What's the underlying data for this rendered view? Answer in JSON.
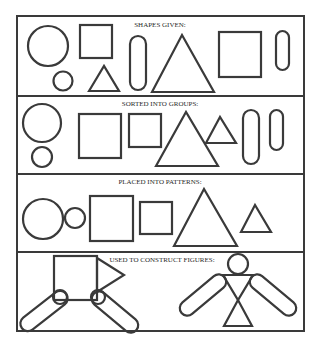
{
  "diagram": {
    "background": "#ffffff",
    "stroke_color": "#3a3a3a",
    "panels": [
      {
        "title": "SHAPES GIVEN:",
        "shapes": [
          "circle-large",
          "circle-small",
          "square-small",
          "triangle-small",
          "capsule-large",
          "triangle-large",
          "square-large",
          "capsule-small"
        ]
      },
      {
        "title": "SORTED INTO GROUPS:",
        "shapes": [
          "circle-large",
          "circle-small",
          "square-large",
          "square-small",
          "triangle-large",
          "triangle-small",
          "capsule-large",
          "capsule-small"
        ]
      },
      {
        "title": "PLACED INTO PATTERNS:",
        "shapes": [
          "circle-large",
          "circle-small",
          "square-large",
          "square-small",
          "triangle-large",
          "triangle-small"
        ]
      },
      {
        "title": "USED TO CONSTRUCT FIGURES:",
        "figures": [
          "square-body-figure",
          "human-figure"
        ]
      }
    ]
  }
}
